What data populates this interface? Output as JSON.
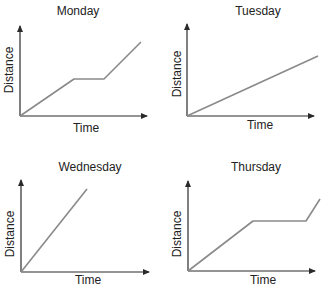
{
  "chart_data": [
    {
      "type": "line",
      "title": "Monday",
      "xlabel": "Time",
      "ylabel": "Distance",
      "ticks": "none",
      "grid": false,
      "x": [
        0,
        0.42,
        0.64,
        0.92
      ],
      "values": [
        0,
        0.38,
        0.38,
        0.78
      ],
      "description": "Steady increase, flat plateau, then steeper increase"
    },
    {
      "type": "line",
      "title": "Tuesday",
      "xlabel": "Time",
      "ylabel": "Distance",
      "ticks": "none",
      "grid": false,
      "x": [
        0,
        1.0
      ],
      "values": [
        0,
        0.62
      ],
      "description": "Constant gentle slope"
    },
    {
      "type": "line",
      "title": "Wednesday",
      "xlabel": "Time",
      "ylabel": "Distance",
      "ticks": "none",
      "grid": false,
      "x": [
        0,
        0.5
      ],
      "values": [
        0,
        0.85
      ],
      "description": "Constant steep slope"
    },
    {
      "type": "line",
      "title": "Thursday",
      "xlabel": "Time",
      "ylabel": "Distance",
      "ticks": "none",
      "grid": false,
      "x": [
        0,
        0.49,
        0.89,
        1.0
      ],
      "values": [
        0,
        0.52,
        0.52,
        0.75
      ],
      "description": "Increase, long plateau, then sharp increase"
    }
  ],
  "panels": [
    {
      "title": "Monday",
      "xlabel": "Time",
      "ylabel": "Distance",
      "origin": [
        20,
        116
      ],
      "xend": 153,
      "ytop": 20,
      "points": "20,116 74,79 104,79 141,42",
      "title_pos": [
        78,
        16
      ],
      "xlabel_pos": [
        86,
        122
      ],
      "ylabel_pos": [
        9,
        70
      ]
    },
    {
      "title": "Tuesday",
      "xlabel": "Time",
      "ylabel": "Distance",
      "origin": [
        187,
        116
      ],
      "xend": 320,
      "ytop": 18,
      "points": "187,116 318,56",
      "title_pos": [
        258,
        6
      ],
      "xlabel_pos": [
        260,
        119
      ],
      "ylabel_pos": [
        178,
        74
      ]
    },
    {
      "title": "Wednesday",
      "xlabel": "Time",
      "ylabel": "Distance",
      "origin": [
        21,
        272
      ],
      "xend": 155,
      "ytop": 174,
      "points": "21,272 87,189",
      "title_pos": [
        90,
        163
      ],
      "xlabel_pos": [
        88,
        275
      ],
      "ylabel_pos": [
        10,
        234
      ]
    },
    {
      "title": "Thursday",
      "xlabel": "Time",
      "ylabel": "Distance",
      "origin": [
        188,
        271
      ],
      "xend": 321,
      "ytop": 175,
      "points": "188,271 253,221 306,221 320,199",
      "title_pos": [
        256,
        163
      ],
      "xlabel_pos": [
        263,
        274
      ],
      "ylabel_pos": [
        177,
        234
      ]
    }
  ],
  "colors": {
    "axis": "#2a2a2a",
    "line": "#8a8a8a",
    "text": "#222222"
  }
}
